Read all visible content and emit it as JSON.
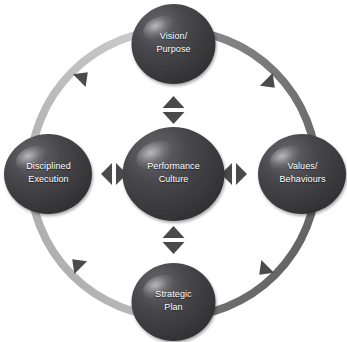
{
  "diagram": {
    "type": "cyclical-relationship-diagram",
    "background_color": "#ffffff",
    "node_fill_dark": "#3a3a3c",
    "node_fill_light": "#55555a",
    "node_text_color": "#ffffff",
    "ring_color_light": "#b9b9b9",
    "ring_color_dark": "#6e6e6e",
    "arrow_color": "#4a4a4c",
    "center": {
      "name": "performance-culture",
      "line1": "Performance",
      "line2": "Culture"
    },
    "nodes": [
      {
        "name": "vision-purpose",
        "position": "top",
        "line1": "Vision/",
        "line2": "Purpose"
      },
      {
        "name": "values-behaviours",
        "position": "right",
        "line1": "Values/",
        "line2": "Behaviours"
      },
      {
        "name": "strategic-plan",
        "position": "bottom",
        "line1": "Strategic",
        "line2": "Plan"
      },
      {
        "name": "disciplined-execution",
        "position": "left",
        "line1": "Disciplined",
        "line2": "Execution"
      }
    ],
    "connectors": [
      {
        "name": "connector-center-top",
        "orientation": "vertical",
        "heads": "double"
      },
      {
        "name": "connector-center-right",
        "orientation": "horizontal",
        "heads": "double"
      },
      {
        "name": "connector-center-bottom",
        "orientation": "vertical",
        "heads": "double"
      },
      {
        "name": "connector-center-left",
        "orientation": "horizontal",
        "heads": "double"
      }
    ],
    "ring_arrowheads": [
      {
        "name": "ring-arrowhead-top-left",
        "direction": "clockwise"
      },
      {
        "name": "ring-arrowhead-top-right",
        "direction": "clockwise"
      },
      {
        "name": "ring-arrowhead-bottom-right",
        "direction": "clockwise"
      },
      {
        "name": "ring-arrowhead-bottom-left",
        "direction": "clockwise"
      }
    ]
  }
}
